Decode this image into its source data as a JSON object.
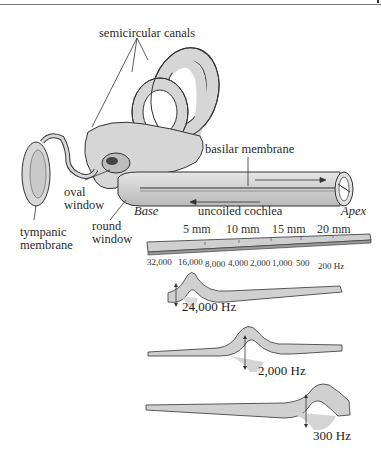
{
  "labels": {
    "semicircular_canals": "semicircular canals",
    "basilar_membrane": "basilar membrane",
    "oval_window": [
      "oval",
      "window"
    ],
    "round_window": [
      "round",
      "window"
    ],
    "tympanic_membrane": [
      "tympanic",
      "membrane"
    ],
    "base": "Base",
    "apex": "Apex",
    "uncoiled_cochlea": "uncoiled cochlea"
  },
  "ruler": {
    "distance_ticks": [
      "5 mm",
      "10 mm",
      "15 mm",
      "20 mm"
    ],
    "frequency_ticks": [
      "32,000",
      "16,000",
      "8,000",
      "4,000",
      "2,000",
      "1,000",
      "500",
      "200 Hz"
    ]
  },
  "waves": [
    {
      "frequency": "24,000 Hz",
      "peak_position": "base"
    },
    {
      "frequency": "2,000 Hz",
      "peak_position": "middle"
    },
    {
      "frequency": "300 Hz",
      "peak_position": "apex"
    }
  ],
  "colors": {
    "tissue_fill": "#d4d4d4",
    "tissue_stroke": "#333333",
    "shadow": "#cfcfcf",
    "text": "#2a2a2a"
  }
}
